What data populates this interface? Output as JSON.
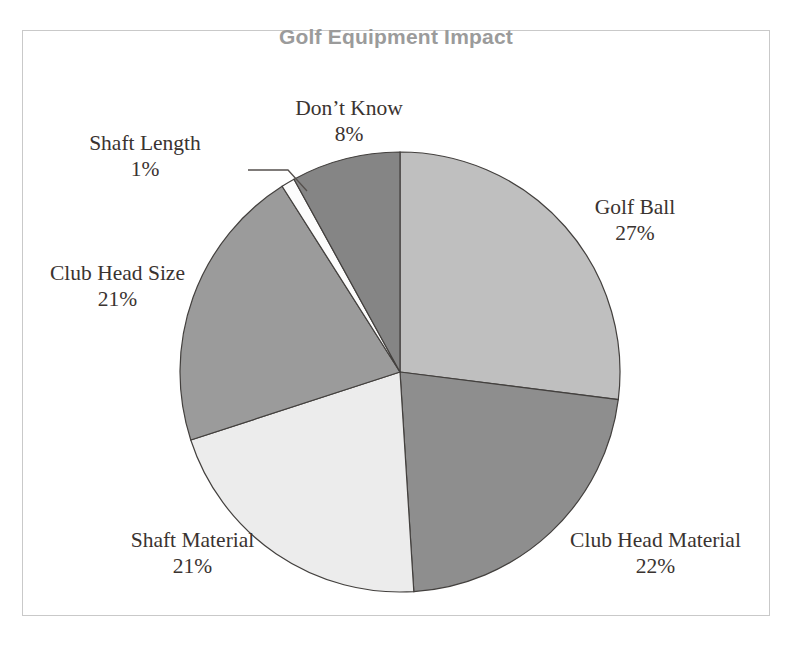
{
  "chart_title": "Golf Equipment Impact",
  "title_color": "#9b9b9b",
  "background_color": "#ffffff",
  "frame_border_color": "#c9c9c9",
  "labels": {
    "dont_know": {
      "name": "Don’t Know",
      "value": "8%"
    },
    "shaft_length": {
      "name": "Shaft Length",
      "value": "1%"
    },
    "club_head_size": {
      "name": "Club Head Size",
      "value": "21%"
    },
    "golf_ball": {
      "name": "Golf Ball",
      "value": "27%"
    },
    "club_head_material": {
      "name": "Club Head Material",
      "value": "22%"
    },
    "shaft_material": {
      "name": "Shaft Material",
      "value": "21%"
    }
  },
  "chart_data": {
    "type": "pie",
    "title": "Golf Equipment Impact",
    "xlabel": "",
    "ylabel": "",
    "legend_position": "none",
    "grid": false,
    "labels_on_slices": false,
    "labels_outside": true,
    "start_angle_deg": 0,
    "direction": "clockwise",
    "center_px": [
      400,
      372
    ],
    "radius_px": 220,
    "total": 100,
    "unit": "%",
    "categories": [
      "Golf Ball",
      "Club Head Material",
      "Shaft Material",
      "Club Head Size",
      "Shaft Length",
      "Don’t Know"
    ],
    "values": [
      27,
      22,
      21,
      21,
      1,
      8
    ],
    "slices": [
      {
        "label": "Golf Ball",
        "value": 27,
        "display": "27%",
        "color": "#bfbfbf",
        "start_deg": 0,
        "end_deg": 97.2
      },
      {
        "label": "Club Head Material",
        "value": 22,
        "display": "22%",
        "color": "#8e8e8e",
        "start_deg": 97.2,
        "end_deg": 176.4
      },
      {
        "label": "Shaft Material",
        "value": 21,
        "display": "21%",
        "color": "#ececec",
        "start_deg": 176.4,
        "end_deg": 252.0
      },
      {
        "label": "Club Head Size",
        "value": 21,
        "display": "21%",
        "color": "#9b9b9b",
        "start_deg": 252.0,
        "end_deg": 327.6
      },
      {
        "label": "Shaft Length",
        "value": 1,
        "display": "1%",
        "color": "#fcfcfc",
        "start_deg": 327.6,
        "end_deg": 331.2
      },
      {
        "label": "Don’t Know",
        "value": 8,
        "display": "8%",
        "color": "#858585",
        "start_deg": 331.2,
        "end_deg": 360.0
      }
    ],
    "slice_outline_color": "#43403e",
    "leader_line": {
      "for": "Shaft Length",
      "color": "#55504d"
    }
  }
}
